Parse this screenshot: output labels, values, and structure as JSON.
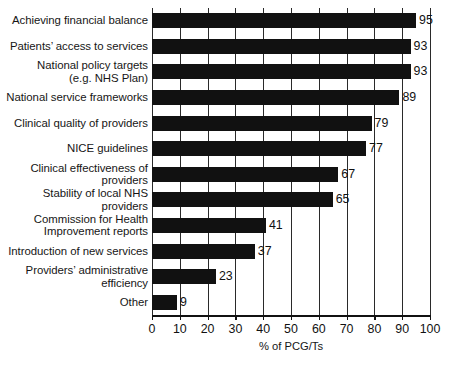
{
  "chart_data": {
    "type": "bar",
    "orientation": "horizontal",
    "title": "",
    "xlabel": "% of PCG/Ts",
    "ylabel": "",
    "xlim": [
      0,
      100
    ],
    "grid": true,
    "legend": null,
    "categories": [
      "Achieving financial balance",
      "Patients’ access to services",
      "National policy targets\n(e.g. NHS Plan)",
      "National service frameworks",
      "Clinical quality of providers",
      "NICE guidelines",
      "Clinical effectiveness of\nproviders",
      "Stability of local NHS\nproviders",
      "Commission for Health\nImprovement reports",
      "Introduction of new services",
      "Providers’ administrative\nefficiency",
      "Other"
    ],
    "values": [
      95,
      93,
      93,
      89,
      79,
      77,
      67,
      65,
      41,
      37,
      23,
      9
    ],
    "value_labels": [
      "95",
      "93",
      "93",
      "89",
      "79",
      "77",
      "67",
      "65",
      "41",
      "37",
      "23",
      "9"
    ],
    "x_ticks": [
      0,
      10,
      20,
      30,
      40,
      50,
      60,
      70,
      80,
      90,
      100
    ],
    "x_tick_labels": [
      "0",
      "10",
      "20",
      "30",
      "40",
      "50",
      "60",
      "70",
      "80",
      "90",
      "100"
    ],
    "bar_color": "#111111",
    "background_color": "#ffffff",
    "gridline_color": "#2a2a2a"
  }
}
